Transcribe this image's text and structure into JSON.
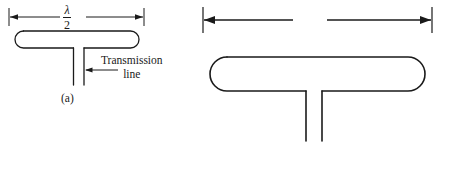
{
  "figure": {
    "background_color": "#ffffff",
    "stroke_color": "#1a1a1a",
    "panels": [
      {
        "id": "a",
        "caption": "(a)",
        "dimension": {
          "label_numerator": "λ",
          "label_denominator": "2",
          "style": "stacked-fraction",
          "arrow_style": "double-ended-with-end-ticks"
        },
        "callout": {
          "line1": "Transmission",
          "line2": "line",
          "leader": "left-pointing-arrow"
        },
        "shape": "stadium-outline-with-two-parallel-stem-lines"
      },
      {
        "id": "b",
        "caption": "(b)",
        "dimension": {
          "label_inline": "λ/2",
          "label_lambda": "λ",
          "label_rest": "/2",
          "style": "inline-label-breaking-dimension-line",
          "arrow_style": "double-ended-with-end-ticks"
        },
        "shape": "stadium-outline-with-two-parallel-stem-lines"
      }
    ]
  }
}
